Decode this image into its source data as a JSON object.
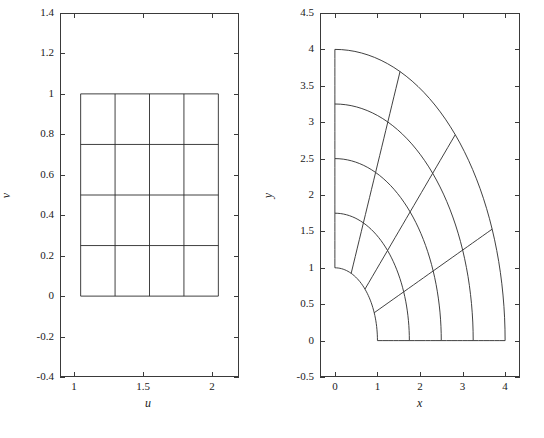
{
  "figure": {
    "background": "#ffffff",
    "line_color": "#2b2b2b",
    "axis_color": "#3a3a3a"
  },
  "chart_data": [
    {
      "type": "line",
      "id": "uv-grid",
      "title": "",
      "xlabel": "u",
      "ylabel": "v",
      "xlim": [
        0.85,
        2.15
      ],
      "ylim": [
        -0.4,
        1.4
      ],
      "xticks": [
        1,
        1.5,
        2
      ],
      "xticklabels": [
        "1",
        "1.5",
        "2"
      ],
      "yticks": [
        -0.4,
        -0.2,
        0,
        0.2,
        0.4,
        0.6,
        0.8,
        1,
        1.2,
        1.4
      ],
      "yticklabels": [
        "-0.4",
        "-0.2",
        "0",
        "0.2",
        "0.4",
        "0.6",
        "0.8",
        "1",
        "1.2",
        "1.4"
      ],
      "grid": false,
      "legend": "none",
      "description": "Rectangular computational grid in the (u,v) plane: 4 columns by 4 rows of cells spanning u from 1 to 2 and v from 0 to 1.",
      "mesh": {
        "u_lines": [
          1,
          1.25,
          1.5,
          1.75,
          2
        ],
        "v_lines": [
          0,
          0.25,
          0.5,
          0.75,
          1
        ],
        "u_range": [
          1,
          2
        ],
        "v_range": [
          0,
          1
        ]
      }
    },
    {
      "type": "line",
      "id": "xy-grid",
      "title": "",
      "xlabel": "x",
      "ylabel": "y",
      "xlim": [
        -0.35,
        4.35
      ],
      "ylim": [
        -0.5,
        4.5
      ],
      "xticks": [
        0,
        1,
        2,
        3,
        4
      ],
      "xticklabels": [
        "0",
        "1",
        "2",
        "3",
        "4"
      ],
      "yticks": [
        -0.5,
        0,
        0.5,
        1,
        1.5,
        2,
        2.5,
        3,
        3.5,
        4,
        4.5
      ],
      "yticklabels": [
        "-0.5",
        "0",
        "0.5",
        "1",
        "1.5",
        "2",
        "2.5",
        "3",
        "3.5",
        "4",
        "4.5"
      ],
      "grid": false,
      "legend": "none",
      "description": "Curvilinear image of the (u,v) grid mapped into the (x,y) plane: a curved quadrilateral region bounded below by the segment from (1,0) to (4,0), on the right by an arc from (4,0) to (3,4), above by an arc from (3,4) to (0,2), and on the left by an arc from (0,2) to (1,0).",
      "mesh": {
        "radial_lines": 5,
        "angular_lines": 5,
        "r_range": [
          1,
          4
        ],
        "theta_range_deg": [
          0,
          90
        ]
      }
    }
  ]
}
